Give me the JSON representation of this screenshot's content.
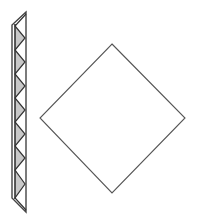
{
  "canvas": {
    "width": 201,
    "height": 223,
    "background": "#ffffff"
  },
  "colors": {
    "stroke": "#444444",
    "fill_shaded": "#c8c8c8",
    "fill_plain": "#ffffff"
  },
  "strip": {
    "outline": "26,12 12,25 12,198 26,212",
    "inner_line": {
      "x1": 15,
      "y1": 24,
      "x2": 15,
      "y2": 199
    },
    "shaded_triangles": [
      "15,26 25,38 15,50",
      "15,50 25,62 15,74",
      "15,74 25,86 15,98",
      "15,98 25,110 15,122",
      "15,122 25,134 15,146",
      "15,146 25,158 15,170",
      "15,170 25,184 15,198"
    ],
    "zigzag": "26,14 15,26 25,38 15,50 25,62 15,74 25,86 15,98 25,110 15,122 25,134 15,146 25,158 15,170 25,184 15,198 26,210"
  },
  "diamond": {
    "points": "112,44 185,118 112,193 40,118"
  }
}
